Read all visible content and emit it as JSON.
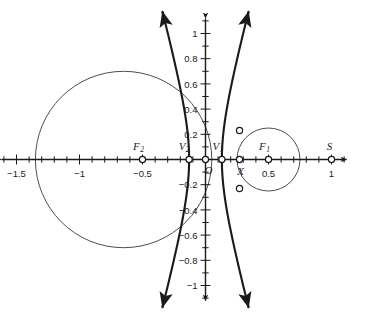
{
  "figure": {
    "background_color": "#ffffff",
    "axis_color": "#1a1a1a",
    "curve_color": "#1a1a1a",
    "thin_curve_color": "#3a3a3a",
    "marker_fill": "#ffffff"
  },
  "axes": {
    "x_label_ticks": [
      "-1.5",
      "-1",
      "-0.5",
      "0.5",
      "1"
    ],
    "y_label_ticks": [
      "1",
      "0.8",
      "0.6",
      "0.4",
      "0.2",
      "-0.2",
      "-0.4",
      "-0.6",
      "-0.8",
      "-1"
    ],
    "x_range": [
      -1.62,
      1.12
    ],
    "y_range": [
      -1.12,
      1.12
    ],
    "minor_tick_step": 0.1,
    "x_arrows": [
      "left",
      "right"
    ],
    "y_arrows": [
      "up",
      "down"
    ]
  },
  "points": [
    {
      "name": "F2",
      "label": "F",
      "sub": "2",
      "x": -0.5,
      "y": 0,
      "label_dx": -4,
      "label_dy": -10
    },
    {
      "name": "V2",
      "label": "V",
      "sub": "2",
      "x": -0.13,
      "y": 0,
      "label_dx": -5,
      "label_dy": -10
    },
    {
      "name": "O",
      "label": "O",
      "sub": "",
      "x": 0.0,
      "y": 0,
      "label_dx": 3,
      "label_dy": 14
    },
    {
      "name": "V1",
      "label": "V",
      "sub": "1",
      "x": 0.13,
      "y": 0,
      "label_dx": -4,
      "label_dy": -10
    },
    {
      "name": "X",
      "label": "X",
      "sub": "",
      "x": 0.27,
      "y": 0,
      "label_dx": 1,
      "label_dy": 15
    },
    {
      "name": "F1",
      "label": "F",
      "sub": "1",
      "x": 0.5,
      "y": 0,
      "label_dx": -4,
      "label_dy": -10
    },
    {
      "name": "S",
      "label": "S",
      "sub": "",
      "x": 1.0,
      "y": 0,
      "label_dx": -2,
      "label_dy": -10
    }
  ],
  "intersection_points": [
    {
      "name": "upper-intersection",
      "x": 0.27,
      "y": 0.23
    },
    {
      "name": "lower-intersection",
      "x": 0.27,
      "y": -0.23
    }
  ],
  "circles": [
    {
      "name": "large-circle",
      "cx": -0.65,
      "cy": 0.0,
      "r": 0.7,
      "stroke_width": 0.9
    },
    {
      "name": "small-circle",
      "cx": 0.5,
      "cy": 0.0,
      "r": 0.25,
      "stroke_width": 0.9
    }
  ],
  "hyperbola": {
    "name": "hyperbola",
    "a": 0.13,
    "c": 0.5,
    "b": 0.4828,
    "stroke_width": 2.1,
    "branches": [
      "left",
      "right"
    ],
    "arrow_ends": 4
  },
  "chart_data": {
    "type": "diagram",
    "title": "",
    "xlabel": "",
    "ylabel": "",
    "xlim": [
      -1.62,
      1.12
    ],
    "ylim": [
      -1.12,
      1.12
    ],
    "grid": false,
    "legend": "none"
  }
}
